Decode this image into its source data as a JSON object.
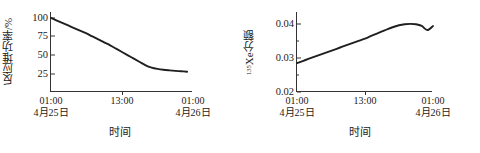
{
  "figure": {
    "panels": [
      {
        "id": "reactor-power",
        "ylabel_main": "反应堆功率/%",
        "ylabel_sup": "",
        "xlabel": "时间",
        "ytick_labels": [
          "100",
          "75",
          "50",
          "25"
        ],
        "xtick_labels": [
          {
            "time": "01:00",
            "date": "4月25日"
          },
          {
            "time": "13:00",
            "date": ""
          },
          {
            "time": "01:00",
            "date": "4月26日"
          }
        ]
      },
      {
        "id": "xenon-fraction",
        "ylabel_main": "Xe分额",
        "ylabel_sup": "135",
        "xlabel": "时间",
        "ytick_labels": [
          "0.04",
          "0.03",
          "0.02"
        ],
        "xtick_labels": [
          {
            "time": "01:00",
            "date": "4月25日"
          },
          {
            "time": "13:00",
            "date": ""
          },
          {
            "time": "01:00",
            "date": "4月26日"
          }
        ]
      }
    ]
  },
  "chart_data": [
    {
      "type": "line",
      "id": "reactor-power",
      "title": "",
      "xlabel": "时间",
      "ylabel": "反应堆功率/%",
      "ylim": [
        0,
        108
      ],
      "yticks": [
        25,
        50,
        75,
        100
      ],
      "ytick_labels": [
        "25",
        "50",
        "75",
        "100"
      ],
      "xlim": [
        0,
        24
      ],
      "xticks": [
        0,
        12,
        24
      ],
      "xtick_labels": [
        "01:00\n4月25日",
        "13:00",
        "01:00\n4月26日"
      ],
      "grid": false,
      "legend": null,
      "x_unit": "hours from 01:00 on 4月25日",
      "x": [
        0,
        1,
        2,
        3,
        4,
        5,
        6,
        7,
        8,
        9,
        10,
        11,
        12,
        13,
        14,
        15,
        16,
        17,
        18,
        19,
        20,
        21,
        22,
        23
      ],
      "values": [
        100,
        96.5,
        93,
        89.5,
        86,
        82.5,
        79,
        75,
        71,
        67,
        63,
        58.5,
        54,
        49.5,
        45,
        40.5,
        36,
        33,
        31.2,
        30,
        29.2,
        28.5,
        28,
        27.4
      ],
      "series": [
        {
          "name": "反应堆功率",
          "values": [
            100,
            96.5,
            93,
            89.5,
            86,
            82.5,
            79,
            75,
            71,
            67,
            63,
            58.5,
            54,
            49.5,
            45,
            40.5,
            36,
            33,
            31.2,
            30,
            29.2,
            28.5,
            28,
            27.4
          ]
        }
      ]
    },
    {
      "type": "line",
      "id": "xenon-fraction",
      "title": "",
      "xlabel": "时间",
      "ylabel": "135Xe分额",
      "ylim": [
        0.02,
        0.0435
      ],
      "yticks": [
        0.02,
        0.03,
        0.04
      ],
      "ytick_labels": [
        "0.02",
        "0.03",
        "0.04"
      ],
      "xlim": [
        0,
        24
      ],
      "xticks": [
        0,
        12,
        24
      ],
      "xtick_labels": [
        "01:00\n4月25日",
        "13:00",
        "01:00\n4月26日"
      ],
      "grid": false,
      "legend": null,
      "x_unit": "hours from 01:00 on 4月25日",
      "x": [
        0,
        1,
        2,
        3,
        4,
        5,
        6,
        7,
        8,
        9,
        10,
        11,
        12,
        13,
        14,
        15,
        16,
        17,
        18,
        19,
        20,
        21,
        22,
        23,
        24
      ],
      "values": [
        0.0285,
        0.0291,
        0.0297,
        0.0303,
        0.0309,
        0.0315,
        0.0321,
        0.0327,
        0.0333,
        0.0339,
        0.0345,
        0.0351,
        0.0357,
        0.0364,
        0.0371,
        0.0378,
        0.0385,
        0.0391,
        0.0396,
        0.0399,
        0.04,
        0.0399,
        0.0394,
        0.0382,
        0.0394
      ],
      "series": [
        {
          "name": "135Xe分额",
          "values": [
            0.0285,
            0.0291,
            0.0297,
            0.0303,
            0.0309,
            0.0315,
            0.0321,
            0.0327,
            0.0333,
            0.0339,
            0.0345,
            0.0351,
            0.0357,
            0.0364,
            0.0371,
            0.0378,
            0.0385,
            0.0391,
            0.0396,
            0.0399,
            0.04,
            0.0399,
            0.0394,
            0.0382,
            0.0394
          ]
        }
      ]
    }
  ],
  "style": {
    "line_color": "#1f1f1f",
    "axis_color": "#333333",
    "background": "#ffffff"
  }
}
